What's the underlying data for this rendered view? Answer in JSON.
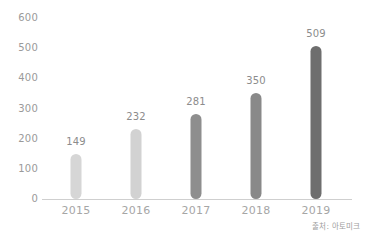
{
  "chart_data": {
    "type": "bar",
    "title": "",
    "subtitle": "",
    "xlabel": "",
    "ylabel": "",
    "categories": [
      "2015",
      "2016",
      "2017",
      "2018",
      "2019"
    ],
    "values": [
      149,
      232,
      281,
      350,
      509
    ],
    "value_labels": [
      "149",
      "232",
      "281",
      "350",
      "509"
    ],
    "ylim": [
      0,
      600
    ],
    "y_ticks": [
      "0",
      "100",
      "200",
      "300",
      "400",
      "500",
      "600"
    ],
    "y_tick_values": [
      0,
      100,
      200,
      300,
      400,
      500,
      600
    ],
    "grid": false,
    "legend": null,
    "legend_position": "none",
    "bar_colors": [
      "#d6d6d6",
      "#d2d2d2",
      "#8e8e8e",
      "#898989",
      "#6e6e6e"
    ],
    "bar_shape": "rounded-pill",
    "axis_color": "#cfcfcf",
    "tick_label_color": "#9a9a9a",
    "category_label_color": "#a6a6a6",
    "value_label_color": "#8c8c8c",
    "background": "#ffffff"
  },
  "annotations": {
    "source_note": "출처: 아토미크"
  }
}
